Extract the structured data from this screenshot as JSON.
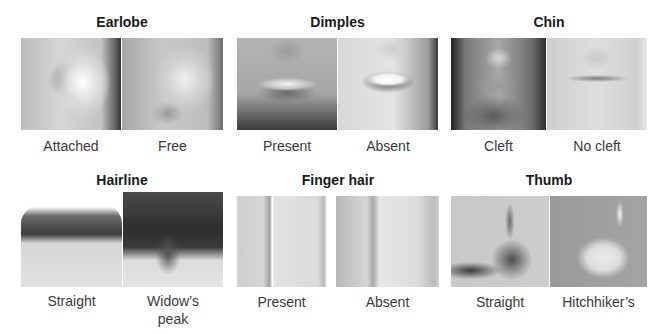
{
  "figure": {
    "panels": [
      {
        "id": "earlobe",
        "title": "Earlobe",
        "options": [
          {
            "label": "Attached",
            "image": "attached-earlobe-photo"
          },
          {
            "label": "Free",
            "image": "free-earlobe-photo"
          }
        ]
      },
      {
        "id": "dimples",
        "title": "Dimples",
        "options": [
          {
            "label": "Present",
            "image": "dimples-present-photo"
          },
          {
            "label": "Absent",
            "image": "dimples-absent-photo"
          }
        ]
      },
      {
        "id": "chin",
        "title": "Chin",
        "options": [
          {
            "label": "Cleft",
            "image": "cleft-chin-photo"
          },
          {
            "label": "No cleft",
            "image": "no-cleft-chin-photo"
          }
        ]
      },
      {
        "id": "hairline",
        "title": "Hairline",
        "options": [
          {
            "label": "Straight",
            "image": "straight-hairline-photo"
          },
          {
            "label": "Widow's peak",
            "label_lines": [
              "Widow’s",
              "peak"
            ],
            "image": "widows-peak-photo"
          }
        ]
      },
      {
        "id": "finger-hair",
        "title": "Finger hair",
        "options": [
          {
            "label": "Present",
            "image": "finger-hair-present-photo"
          },
          {
            "label": "Absent",
            "image": "finger-hair-absent-photo"
          }
        ]
      },
      {
        "id": "thumb",
        "title": "Thumb",
        "options": [
          {
            "label": "Straight",
            "image": "straight-thumb-photo"
          },
          {
            "label": "Hitchhiker's",
            "label_display": "Hitchhiker’s",
            "image": "hitchhikers-thumb-photo"
          }
        ]
      }
    ]
  }
}
